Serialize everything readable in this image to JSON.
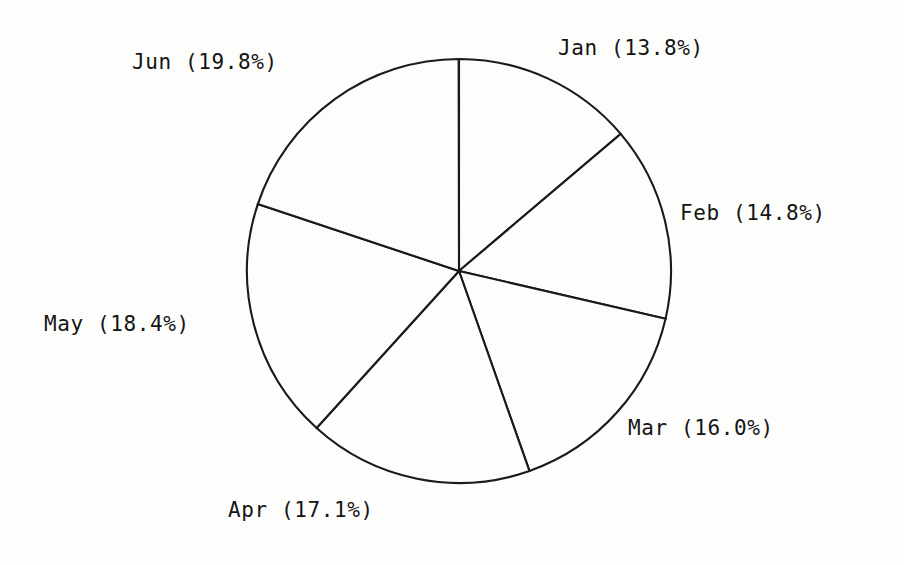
{
  "figure": {
    "background_color": "#fdfdfb",
    "line_color": "#1a1a1a",
    "text_color": "#141414"
  },
  "chart_data": {
    "type": "pie",
    "title": "",
    "subtitle": "",
    "xlabel": "",
    "ylabel": "",
    "grid": false,
    "legend_position": "none",
    "start_angle_deg": 90,
    "direction": "clockwise",
    "center_px": [
      459,
      271
    ],
    "radius_px": 212,
    "categories": [
      "Jan",
      "Feb",
      "Mar",
      "Apr",
      "May",
      "Jun"
    ],
    "values": [
      13.8,
      14.8,
      16.0,
      17.1,
      18.4,
      19.8
    ],
    "value_unit": "%",
    "total": 99.9,
    "labels": [
      "Jan (13.8%)",
      "Feb (14.8%)",
      "Mar (16.0%)",
      "Apr (17.1%)",
      "May (18.4%)",
      "Jun (19.8%)"
    ],
    "slices": [
      {
        "name": "Jan",
        "percent": 13.8,
        "label": "Jan (13.8%)",
        "start_deg": 0.0,
        "end_deg": 49.7,
        "label_x": 558,
        "label_y": 38
      },
      {
        "name": "Feb",
        "percent": 14.8,
        "label": "Feb (14.8%)",
        "start_deg": 49.7,
        "end_deg": 103.0,
        "label_x": 680,
        "label_y": 203
      },
      {
        "name": "Mar",
        "percent": 16.0,
        "label": "Mar (16.0%)",
        "start_deg": 103.0,
        "end_deg": 160.6,
        "label_x": 628,
        "label_y": 418
      },
      {
        "name": "Apr",
        "percent": 17.1,
        "label": "Apr (17.1%)",
        "start_deg": 160.6,
        "end_deg": 222.2,
        "label_x": 228,
        "label_y": 500
      },
      {
        "name": "May",
        "percent": 18.4,
        "label": "May (18.4%)",
        "start_deg": 222.2,
        "end_deg": 288.4,
        "label_x": 44,
        "label_y": 314
      },
      {
        "name": "Jun",
        "percent": 19.8,
        "label": "Jun (19.8%)",
        "start_deg": 288.4,
        "end_deg": 359.9,
        "label_x": 132,
        "label_y": 52
      }
    ]
  }
}
